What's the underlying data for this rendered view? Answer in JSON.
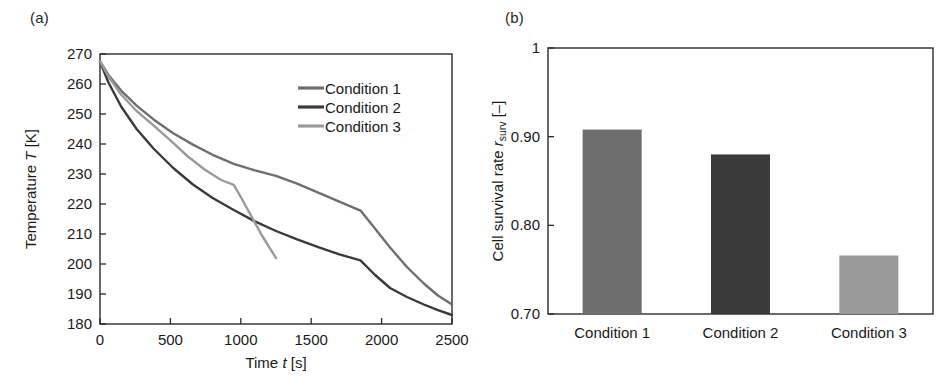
{
  "figure": {
    "panel_a_label": "(a)",
    "panel_b_label": "(b)"
  },
  "chart_data": [
    {
      "type": "line",
      "panel": "(a)",
      "title": "",
      "xlabel": "Time t [s]",
      "xlabel_parts": {
        "pre": "Time ",
        "symbol": "t",
        "post": " [s]"
      },
      "ylabel": "Temperature T [K]",
      "ylabel_parts": {
        "pre": "Temperature ",
        "symbol": "T",
        "post": " [K]"
      },
      "xlim": [
        0,
        2500
      ],
      "ylim": [
        180,
        270
      ],
      "xticks": [
        0,
        500,
        1000,
        1500,
        2000,
        2500
      ],
      "xtick_labels": [
        "0",
        "500",
        "1000",
        "1500",
        "2000",
        "2500"
      ],
      "yticks": [
        180,
        190,
        200,
        210,
        220,
        230,
        240,
        250,
        260,
        270
      ],
      "ytick_labels": [
        "180",
        "190",
        "200",
        "210",
        "220",
        "230",
        "240",
        "250",
        "260",
        "270"
      ],
      "grid": false,
      "legend_position": "upper right",
      "series": [
        {
          "name": "Condition 1",
          "color": "#6e6e6e",
          "x": [
            0,
            60,
            150,
            260,
            380,
            520,
            660,
            800,
            950,
            1100,
            1250,
            1400,
            1550,
            1700,
            1850,
            1950,
            2060,
            2180,
            2300,
            2400,
            2500
          ],
          "y": [
            267.5,
            263.0,
            257.8,
            252.8,
            248.2,
            243.6,
            239.8,
            236.4,
            233.4,
            231.2,
            229.4,
            226.8,
            223.8,
            220.8,
            217.8,
            212.0,
            205.5,
            199.0,
            193.5,
            189.5,
            186.5
          ]
        },
        {
          "name": "Condition 2",
          "color": "#3a3a3a",
          "x": [
            0,
            60,
            150,
            260,
            380,
            520,
            660,
            800,
            950,
            1100,
            1250,
            1400,
            1550,
            1700,
            1850,
            1950,
            2060,
            2180,
            2300,
            2400,
            2500
          ],
          "y": [
            267.5,
            260.5,
            252.5,
            245.0,
            238.5,
            232.0,
            226.5,
            222.0,
            218.0,
            214.2,
            211.0,
            208.2,
            205.6,
            203.2,
            201.2,
            196.5,
            192.0,
            189.0,
            186.5,
            184.6,
            183.0
          ]
        },
        {
          "name": "Condition 3",
          "color": "#9a9a9a",
          "x": [
            0,
            60,
            150,
            260,
            380,
            500,
            620,
            740,
            860,
            950,
            1010,
            1080,
            1150,
            1250
          ],
          "y": [
            267.5,
            262.5,
            256.5,
            251.0,
            246.2,
            241.2,
            236.0,
            231.6,
            228.0,
            226.4,
            221.5,
            215.5,
            209.5,
            202.0
          ]
        }
      ]
    },
    {
      "type": "bar",
      "panel": "(b)",
      "title": "",
      "xlabel": "",
      "ylabel": "Cell survival rate r_surv [-]",
      "ylabel_parts": {
        "pre": "Cell survival rate ",
        "symbol": "r",
        "subscript": "surv",
        "post": " [–]"
      },
      "categories": [
        "Condition 1",
        "Condition 2",
        "Condition 3"
      ],
      "values": [
        0.908,
        0.88,
        0.766
      ],
      "bar_colors": [
        "#6e6e6e",
        "#3a3a3a",
        "#9a9a9a"
      ],
      "ylim": [
        0.7,
        1.0
      ],
      "yticks": [
        0.7,
        0.8,
        0.9,
        1.0
      ],
      "ytick_labels": [
        "0.70",
        "0.80",
        "0.90",
        "1"
      ],
      "grid": false,
      "legend_position": "none"
    }
  ]
}
